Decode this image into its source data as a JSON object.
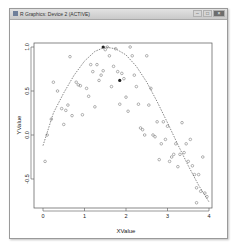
{
  "window": {
    "title": "R Graphics: Device 2 (ACTIVE)",
    "buttons": {
      "minimize": "–",
      "maximize": "□",
      "close": "×"
    }
  },
  "chart_data": {
    "type": "scatter",
    "title": "",
    "xlabel": "XValue",
    "ylabel": "YValue",
    "xlim": [
      0,
      4
    ],
    "ylim": [
      -0.75,
      1.05
    ],
    "x_ticks": [
      0,
      1,
      2,
      3,
      4
    ],
    "x_tick_labels": [
      "0",
      "1",
      "2",
      "3",
      "4"
    ],
    "y_ticks": [
      -0.5,
      0.0,
      0.5,
      1.0
    ],
    "y_tick_labels": [
      "-0.5",
      "0.0",
      "0.5",
      "1.0"
    ],
    "grid": false,
    "legend": null,
    "series": [
      {
        "name": "points",
        "style": "open-circle",
        "points": [
          [
            0.05,
            -0.3
          ],
          [
            0.1,
            0.0
          ],
          [
            0.2,
            0.18
          ],
          [
            0.25,
            0.6
          ],
          [
            0.35,
            0.5
          ],
          [
            0.45,
            0.3
          ],
          [
            0.5,
            0.12
          ],
          [
            0.55,
            0.28
          ],
          [
            0.6,
            0.34
          ],
          [
            0.65,
            0.89
          ],
          [
            0.7,
            0.22
          ],
          [
            0.8,
            0.6
          ],
          [
            0.85,
            0.57
          ],
          [
            0.9,
            0.56
          ],
          [
            0.95,
            0.23
          ],
          [
            1.05,
            0.53
          ],
          [
            1.1,
            0.44
          ],
          [
            1.15,
            0.8
          ],
          [
            1.2,
            0.72
          ],
          [
            1.25,
            0.32
          ],
          [
            1.3,
            0.8
          ],
          [
            1.35,
            0.62
          ],
          [
            1.4,
            0.68
          ],
          [
            1.45,
            0.73
          ],
          [
            1.5,
            0.97
          ],
          [
            1.55,
            1.0
          ],
          [
            1.6,
            0.9
          ],
          [
            1.65,
            0.55
          ],
          [
            1.7,
            0.78
          ],
          [
            1.75,
            0.98
          ],
          [
            1.8,
            0.72
          ],
          [
            1.85,
            0.35
          ],
          [
            1.9,
            0.7
          ],
          [
            1.95,
            0.64
          ],
          [
            2.0,
            0.43
          ],
          [
            2.05,
            0.27
          ],
          [
            2.1,
            1.0
          ],
          [
            2.15,
            0.9
          ],
          [
            2.2,
            0.68
          ],
          [
            2.25,
            0.55
          ],
          [
            2.3,
            0.35
          ],
          [
            2.35,
            0.08
          ],
          [
            2.4,
            0.06
          ],
          [
            2.45,
            0.0
          ],
          [
            2.5,
            0.9
          ],
          [
            2.55,
            0.34
          ],
          [
            2.6,
            0.53
          ],
          [
            2.65,
            0.0
          ],
          [
            2.7,
            -0.02
          ],
          [
            2.75,
            0.15
          ],
          [
            2.8,
            -0.28
          ],
          [
            2.85,
            -0.1
          ],
          [
            2.9,
            0.15
          ],
          [
            2.95,
            -0.05
          ],
          [
            3.0,
            0.1
          ],
          [
            3.05,
            -0.3
          ],
          [
            3.1,
            -0.25
          ],
          [
            3.15,
            -0.22
          ],
          [
            3.2,
            -0.1
          ],
          [
            3.25,
            -0.36
          ],
          [
            3.3,
            -0.22
          ],
          [
            3.35,
            0.14
          ],
          [
            3.4,
            -0.2
          ],
          [
            3.45,
            -0.1
          ],
          [
            3.5,
            -0.3
          ],
          [
            3.55,
            -0.05
          ],
          [
            3.6,
            -0.35
          ],
          [
            3.65,
            -0.45
          ],
          [
            3.7,
            -0.6
          ],
          [
            3.75,
            -0.45
          ],
          [
            3.8,
            -0.64
          ],
          [
            3.85,
            -0.25
          ],
          [
            3.9,
            -0.66
          ],
          [
            3.95,
            -0.7
          ],
          [
            3.7,
            -0.77
          ]
        ]
      },
      {
        "name": "highlight",
        "style": "filled-circle",
        "points": [
          [
            1.45,
            1.0
          ],
          [
            1.85,
            0.62
          ]
        ]
      },
      {
        "name": "fit",
        "style": "dashed-line",
        "function": "sin(x)",
        "x": [
          0,
          0.25,
          0.5,
          0.75,
          1.0,
          1.25,
          1.5,
          1.75,
          2.0,
          2.25,
          2.5,
          2.75,
          3.0,
          3.25,
          3.5,
          3.75,
          4.0
        ],
        "y": [
          -0.12,
          0.25,
          0.48,
          0.68,
          0.84,
          0.95,
          1.0,
          0.98,
          0.91,
          0.78,
          0.6,
          0.38,
          0.14,
          -0.11,
          -0.35,
          -0.57,
          -0.76
        ]
      }
    ]
  }
}
